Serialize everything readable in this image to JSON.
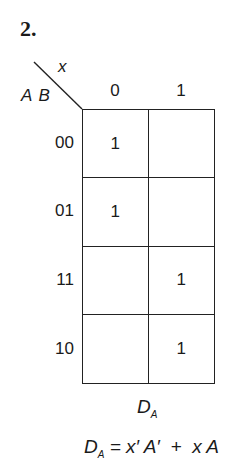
{
  "problem_number": "2.",
  "kmap": {
    "column_variable": "x",
    "row_variables": "A B",
    "column_headers": [
      "0",
      "1"
    ],
    "row_headers": [
      "00",
      "01",
      "11",
      "10"
    ],
    "cells": [
      [
        "1",
        ""
      ],
      [
        "1",
        ""
      ],
      [
        "",
        "1"
      ],
      [
        "",
        "1"
      ]
    ],
    "map_name": "D",
    "map_name_sub": "A"
  },
  "equation": {
    "lhs": "D",
    "lhs_sub": "A",
    "rhs": " = x′ A′  +  x A"
  }
}
